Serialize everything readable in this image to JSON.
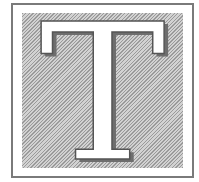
{
  "drop_cap": {
    "letter": "T",
    "style": "hatched-box",
    "colors": {
      "border": "#7a7a7a",
      "hatch_dark": "#9a9a9a",
      "hatch_light": "#d2d2d2",
      "letter_fill": "#ffffff",
      "letter_shadow": "#6e6e6e"
    }
  }
}
